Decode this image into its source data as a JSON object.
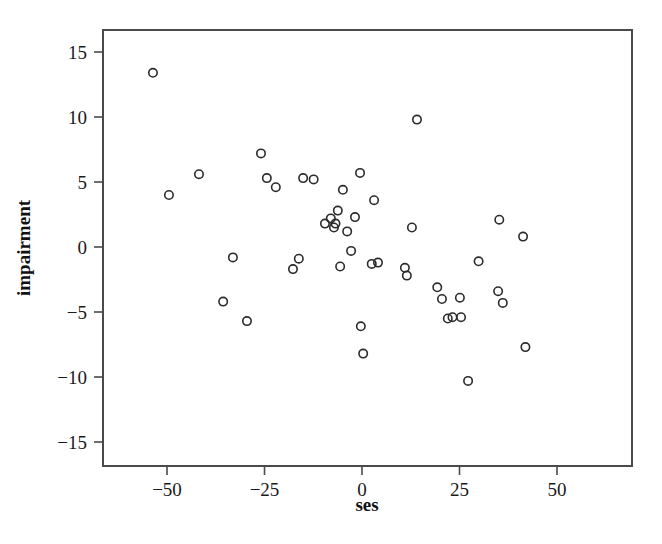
{
  "chart_data": {
    "type": "scatter",
    "title": "",
    "xlabel": "ses",
    "ylabel": "impairment",
    "xlim": [
      -67,
      69
    ],
    "ylim": [
      -16.6,
      16.7
    ],
    "xticks": [
      -50,
      -25,
      0,
      25,
      50
    ],
    "xtick_labels": [
      "−50",
      "−25",
      "0",
      "25",
      "50"
    ],
    "yticks": [
      -15,
      -10,
      -5,
      0,
      5,
      10,
      15
    ],
    "ytick_labels": [
      "−15",
      "−10",
      "−5",
      "0",
      "5",
      "10",
      "15"
    ],
    "grid": false,
    "legend": false,
    "marker": "open-circle",
    "marker_color": "#2b2b2b",
    "n_points": 46,
    "points": [
      {
        "x": -53.6,
        "y": 13.4
      },
      {
        "x": -49.5,
        "y": 4.0
      },
      {
        "x": -41.8,
        "y": 5.6
      },
      {
        "x": -33.1,
        "y": -0.8
      },
      {
        "x": -35.6,
        "y": -4.2
      },
      {
        "x": -29.5,
        "y": -5.7
      },
      {
        "x": -25.9,
        "y": 7.2
      },
      {
        "x": -24.4,
        "y": 5.3
      },
      {
        "x": -22.1,
        "y": 4.6
      },
      {
        "x": -17.7,
        "y": -1.7
      },
      {
        "x": -16.2,
        "y": -0.9
      },
      {
        "x": -15.1,
        "y": 5.3
      },
      {
        "x": -9.5,
        "y": 1.8
      },
      {
        "x": -8.0,
        "y": 2.2
      },
      {
        "x": -7.2,
        "y": 1.5
      },
      {
        "x": -6.2,
        "y": 2.8
      },
      {
        "x": -5.6,
        "y": -1.5
      },
      {
        "x": -4.9,
        "y": 4.4
      },
      {
        "x": -3.8,
        "y": 1.2
      },
      {
        "x": -2.8,
        "y": -0.3
      },
      {
        "x": -0.5,
        "y": 5.7
      },
      {
        "x": -0.3,
        "y": -6.1
      },
      {
        "x": 0.3,
        "y": -8.2
      },
      {
        "x": 3.1,
        "y": 3.6
      },
      {
        "x": 4.1,
        "y": -1.2
      },
      {
        "x": 11.0,
        "y": -1.6
      },
      {
        "x": 11.5,
        "y": -2.2
      },
      {
        "x": 12.8,
        "y": 1.5
      },
      {
        "x": 14.1,
        "y": 9.8
      },
      {
        "x": 19.3,
        "y": -3.1
      },
      {
        "x": 20.5,
        "y": -4.0
      },
      {
        "x": 23.2,
        "y": -5.4
      },
      {
        "x": 25.4,
        "y": -5.4
      },
      {
        "x": 25.1,
        "y": -3.9
      },
      {
        "x": 27.2,
        "y": -10.3
      },
      {
        "x": 29.9,
        "y": -1.1
      },
      {
        "x": 34.9,
        "y": -3.4
      },
      {
        "x": 35.2,
        "y": 2.1
      },
      {
        "x": 36.1,
        "y": -4.3
      },
      {
        "x": 41.3,
        "y": 0.8
      },
      {
        "x": 41.9,
        "y": -7.7
      },
      {
        "x": -12.4,
        "y": 5.2
      },
      {
        "x": -1.8,
        "y": 2.3
      },
      {
        "x": -6.8,
        "y": 1.8
      },
      {
        "x": 2.5,
        "y": -1.3
      },
      {
        "x": 22.0,
        "y": -5.5
      }
    ]
  },
  "geometry": {
    "plot_left": 103,
    "plot_right": 632,
    "plot_top": 30,
    "plot_bottom": 466,
    "x_zero_px": 362,
    "x_unit_px": 3.9,
    "y_zero_px": 247,
    "y_unit_px": 13.0
  }
}
